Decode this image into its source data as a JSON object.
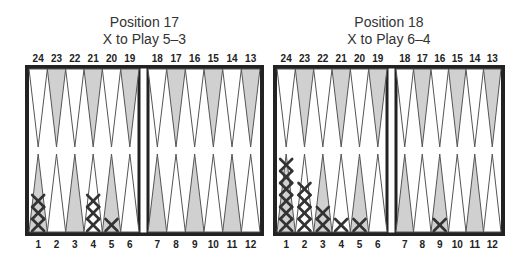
{
  "diagrams": [
    {
      "id": "position-17",
      "title": "Position 17",
      "subtitle": "X to Play 5–3",
      "top_labels": [
        "24",
        "23",
        "22",
        "21",
        "20",
        "19",
        "18",
        "17",
        "16",
        "15",
        "14",
        "13"
      ],
      "bottom_labels": [
        "1",
        "2",
        "3",
        "4",
        "5",
        "6",
        "7",
        "8",
        "9",
        "10",
        "11",
        "12"
      ],
      "checkers": [
        {
          "point": 1,
          "count": 3,
          "player": "X"
        },
        {
          "point": 4,
          "count": 3,
          "player": "X"
        },
        {
          "point": 5,
          "count": 1,
          "player": "X"
        }
      ]
    },
    {
      "id": "position-18",
      "title": "Position 18",
      "subtitle": "X to Play 6–4",
      "top_labels": [
        "24",
        "23",
        "22",
        "21",
        "20",
        "19",
        "18",
        "17",
        "16",
        "15",
        "14",
        "13"
      ],
      "bottom_labels": [
        "1",
        "2",
        "3",
        "4",
        "5",
        "6",
        "7",
        "8",
        "9",
        "10",
        "11",
        "12"
      ],
      "checkers": [
        {
          "point": 1,
          "count": 6,
          "player": "X"
        },
        {
          "point": 2,
          "count": 4,
          "player": "X"
        },
        {
          "point": 3,
          "count": 2,
          "player": "X"
        },
        {
          "point": 4,
          "count": 1,
          "player": "X"
        },
        {
          "point": 5,
          "count": 1,
          "player": "X"
        },
        {
          "point": 9,
          "count": 1,
          "player": "X"
        }
      ]
    }
  ],
  "colors": {
    "frame": "#222222",
    "point_light": "#ffffff",
    "point_dark": "#d0d0d0",
    "point_outline": "#555555",
    "checker": "#333333"
  }
}
